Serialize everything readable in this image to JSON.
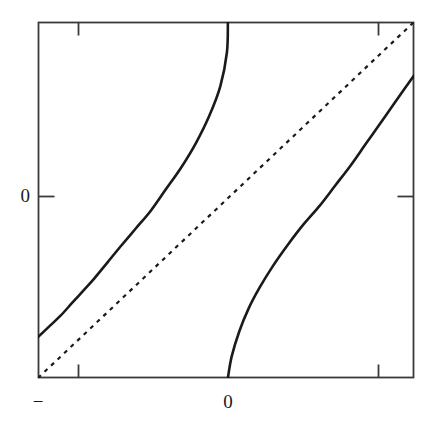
{
  "figure": {
    "background_color": "#ffffff",
    "frame_color": "#3a3a3a",
    "curve_color": "#1a1a1a"
  },
  "axes": {
    "y_tick_labels": [
      {
        "name": "y-tick-zero",
        "text": "0",
        "value": 0
      }
    ],
    "x_tick_labels": [
      {
        "name": "x-tick-minus",
        "text": "−",
        "value": -1
      },
      {
        "name": "x-tick-zero",
        "text": "0",
        "value": 0
      }
    ]
  },
  "chart_data": {
    "type": "line",
    "title": "",
    "xlabel": "",
    "ylabel": "",
    "xlim": [
      -1.0,
      1.0
    ],
    "ylim": [
      -1.0,
      1.0
    ],
    "xticks": [
      -1.0,
      -0.785,
      0.0,
      0.785
    ],
    "xticklabels": [
      "−",
      "",
      "0",
      ""
    ],
    "yticks": [
      0.0
    ],
    "yticklabels": [
      "0"
    ],
    "grid": false,
    "legend": "none",
    "series": [
      {
        "name": "identity-line",
        "style": "dashed",
        "color": "#1a1a1a",
        "linewidth": 2.2,
        "dash_pattern": [
          4,
          5
        ],
        "x": [
          -1.0,
          1.0
        ],
        "y": [
          -1.0,
          1.0
        ]
      },
      {
        "name": "map-branch-left",
        "style": "solid",
        "color": "#1a1a1a",
        "linewidth": 2.6,
        "x": [
          -1.0,
          -0.94,
          -0.88,
          -0.82,
          -0.76,
          -0.7,
          -0.63,
          -0.56,
          -0.48,
          -0.4,
          -0.32,
          -0.24,
          -0.16,
          -0.09,
          -0.03,
          0.005,
          0.01
        ],
        "y": [
          -0.77,
          -0.71,
          -0.65,
          -0.58,
          -0.51,
          -0.44,
          -0.35,
          -0.26,
          -0.16,
          -0.06,
          0.06,
          0.18,
          0.32,
          0.47,
          0.64,
          0.83,
          1.0
        ]
      },
      {
        "name": "map-branch-right",
        "style": "solid",
        "color": "#1a1a1a",
        "linewidth": 2.6,
        "x": [
          0.01,
          0.03,
          0.07,
          0.12,
          0.18,
          0.25,
          0.33,
          0.41,
          0.5,
          0.58,
          0.66,
          0.74,
          0.82,
          0.9,
          0.96,
          1.0
        ],
        "y": [
          -1.0,
          -0.88,
          -0.74,
          -0.61,
          -0.49,
          -0.37,
          -0.25,
          -0.14,
          -0.03,
          0.08,
          0.19,
          0.31,
          0.43,
          0.55,
          0.64,
          0.7
        ]
      }
    ]
  }
}
